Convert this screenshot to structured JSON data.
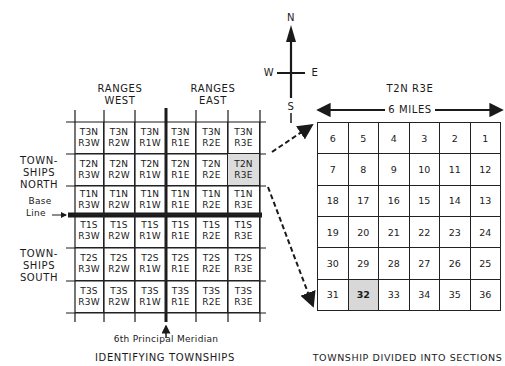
{
  "compass": {
    "north": "N",
    "south": "S",
    "east": "E",
    "west": "W"
  },
  "left_diagram": {
    "ranges_west": [
      "RANGES",
      "WEST"
    ],
    "ranges_east": [
      "RANGES",
      "EAST"
    ],
    "townships_north": [
      "TOWN-",
      "SHIPS",
      "NORTH"
    ],
    "townships_south": [
      "TOWN-",
      "SHIPS",
      "SOUTH"
    ],
    "base_line": [
      "Base",
      "Line"
    ],
    "meridian_label": "6th Principal Meridian",
    "caption": "IDENTIFYING TOWNSHIPS",
    "highlighted_township": "T2N R3E",
    "rows": [
      [
        [
          "T3N",
          "R3W"
        ],
        [
          "T3N",
          "R2W"
        ],
        [
          "T3N",
          "R1W"
        ],
        [
          "T3N",
          "R1E"
        ],
        [
          "T3N",
          "R2E"
        ],
        [
          "T3N",
          "R3E"
        ]
      ],
      [
        [
          "T2N",
          "R3W"
        ],
        [
          "T2N",
          "R2W"
        ],
        [
          "T2N",
          "R1W"
        ],
        [
          "T2N",
          "R1E"
        ],
        [
          "T2N",
          "R2E"
        ],
        [
          "T2N",
          "R3E"
        ]
      ],
      [
        [
          "T1N",
          "R3W"
        ],
        [
          "T1N",
          "R2W"
        ],
        [
          "T1N",
          "R1W"
        ],
        [
          "T1N",
          "R1E"
        ],
        [
          "T1N",
          "R2E"
        ],
        [
          "T1N",
          "R3E"
        ]
      ],
      [
        [
          "T1S",
          "R3W"
        ],
        [
          "T1S",
          "R2W"
        ],
        [
          "T1S",
          "R1W"
        ],
        [
          "T1S",
          "R1E"
        ],
        [
          "T1S",
          "R2E"
        ],
        [
          "T1S",
          "R3E"
        ]
      ],
      [
        [
          "T2S",
          "R3W"
        ],
        [
          "T2S",
          "R2W"
        ],
        [
          "T2S",
          "R1W"
        ],
        [
          "T2S",
          "R1E"
        ],
        [
          "T2S",
          "R2E"
        ],
        [
          "T2S",
          "R3E"
        ]
      ],
      [
        [
          "T3S",
          "R3W"
        ],
        [
          "T3S",
          "R2W"
        ],
        [
          "T3S",
          "R1W"
        ],
        [
          "T3S",
          "R1E"
        ],
        [
          "T3S",
          "R2E"
        ],
        [
          "T3S",
          "R3E"
        ]
      ]
    ]
  },
  "right_diagram": {
    "title": "T2N R3E",
    "width_label": "6 MILES",
    "caption": "TOWNSHIP DIVIDED INTO SECTIONS",
    "highlighted_section": "32",
    "sections": [
      [
        "6",
        "5",
        "4",
        "3",
        "2",
        "1"
      ],
      [
        "7",
        "8",
        "9",
        "10",
        "11",
        "12"
      ],
      [
        "18",
        "17",
        "16",
        "15",
        "14",
        "13"
      ],
      [
        "19",
        "20",
        "21",
        "22",
        "23",
        "24"
      ],
      [
        "30",
        "29",
        "28",
        "27",
        "26",
        "25"
      ],
      [
        "31",
        "32",
        "33",
        "34",
        "35",
        "36"
      ]
    ]
  },
  "colors": {
    "line": "#1a1a1a",
    "shade": "#d8d8d8",
    "background": "#ffffff"
  }
}
